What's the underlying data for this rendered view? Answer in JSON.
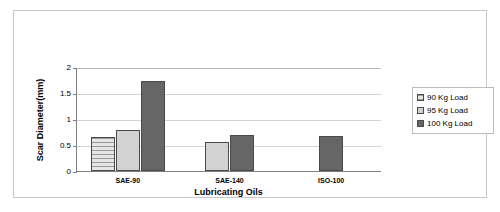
{
  "chart_data": {
    "type": "bar",
    "title": "",
    "subtitle": "",
    "xlabel": "Lubricating Oils",
    "ylabel": "Scar Diameter(mm)",
    "categories": [
      "SAE-90",
      "SAE-140",
      "ISO-100"
    ],
    "series": [
      {
        "name": "90 Kg Load",
        "values": [
          0.66,
          null,
          null
        ],
        "color": "#d9d9d9",
        "pattern": "horizontal-stripes"
      },
      {
        "name": "95 Kg Load",
        "values": [
          0.78,
          0.56,
          null
        ],
        "color": "#d2d2d2",
        "pattern": "solid"
      },
      {
        "name": "100 Kg Load",
        "values": [
          1.74,
          0.7,
          0.68
        ],
        "color": "#666666",
        "pattern": "solid"
      }
    ],
    "ylim": [
      0,
      2
    ],
    "yticks": [
      0,
      0.5,
      1,
      1.5,
      2
    ],
    "ytick_labels": [
      "0",
      "0.5",
      "1",
      "1.5",
      "2"
    ],
    "grid": true,
    "grid_axis": "y",
    "legend_position": "right",
    "legend_border": true,
    "plot_background": "#ffffff",
    "bar_border_color": "#4a4a4a",
    "gridline_color": "#d4d4d4",
    "axis_color": "#808080"
  },
  "legend": {
    "entries": [
      {
        "label": "90 Kg Load"
      },
      {
        "label": "95 Kg Load"
      },
      {
        "label": "100 Kg Load"
      }
    ]
  }
}
